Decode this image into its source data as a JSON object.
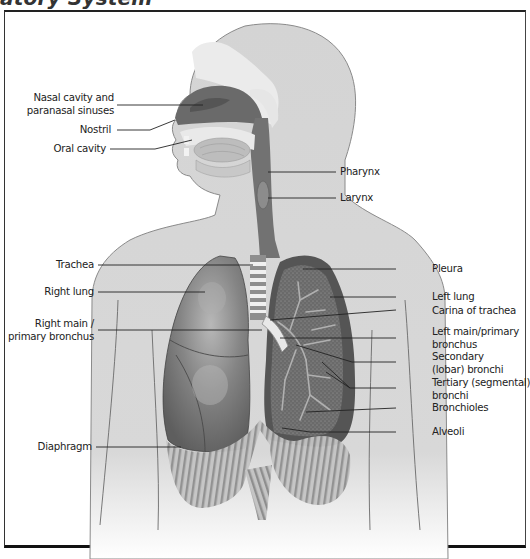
{
  "title": "atory System",
  "colors": {
    "skin": "#d2d2d2",
    "skin_outline": "#7a7a7a",
    "bone_light": "#ececec",
    "airway_dark": "#6e6e6e",
    "lung_right": "#7c7c7c",
    "lung_left_dark": "#555555",
    "lung_left_inner": "#8a8a8a",
    "diaphragm": "#b4b4b4",
    "leader_line": "#222222",
    "frame": "#222222"
  },
  "labels_left": [
    {
      "id": "nasal",
      "lines": [
        "Nasal cavity and",
        "paranasal sinuses"
      ]
    },
    {
      "id": "nostril",
      "lines": [
        "Nostril"
      ]
    },
    {
      "id": "oral",
      "lines": [
        "Oral cavity"
      ]
    },
    {
      "id": "trachea",
      "lines": [
        "Trachea"
      ]
    },
    {
      "id": "right_lung",
      "lines": [
        "Right lung"
      ]
    },
    {
      "id": "right_main",
      "lines": [
        "Right main /",
        "primary bronchus"
      ]
    },
    {
      "id": "diaphragm",
      "lines": [
        "Diaphragm"
      ]
    }
  ],
  "labels_right": [
    {
      "id": "pharynx",
      "lines": [
        "Pharynx"
      ]
    },
    {
      "id": "larynx",
      "lines": [
        "Larynx"
      ]
    },
    {
      "id": "pleura",
      "lines": [
        "Pleura"
      ]
    },
    {
      "id": "left_lung",
      "lines": [
        "Left lung"
      ]
    },
    {
      "id": "carina",
      "lines": [
        "Carina of trachea"
      ]
    },
    {
      "id": "left_main",
      "lines": [
        "Left main/primary",
        "bronchus"
      ]
    },
    {
      "id": "secondary",
      "lines": [
        "Secondary",
        "(lobar) bronchi"
      ]
    },
    {
      "id": "tertiary",
      "lines": [
        "Tertiary (segmental)",
        "bronchi"
      ]
    },
    {
      "id": "bronchioles",
      "lines": [
        "Bronchioles"
      ]
    },
    {
      "id": "alveoli",
      "lines": [
        "Alveoli"
      ]
    }
  ]
}
